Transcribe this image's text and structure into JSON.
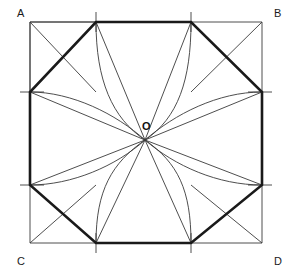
{
  "figure": {
    "type": "geometric-diagram",
    "canvas": {
      "width": 291,
      "height": 275,
      "background": "#ffffff"
    },
    "colors": {
      "thin_stroke": "#3a3a3a",
      "thick_stroke": "#1a1a1a",
      "label_text": "#1a1a1a"
    },
    "stroke_widths": {
      "thin": 0.9,
      "thick": 2.6
    },
    "square": {
      "name": "ABCD",
      "left": 30,
      "top": 22,
      "right": 262,
      "bottom": 243,
      "corners": [
        {
          "id": "A",
          "label": "A",
          "x": 30,
          "y": 22,
          "label_x": 17,
          "label_y": 17
        },
        {
          "id": "B",
          "label": "B",
          "x": 262,
          "y": 22,
          "label_x": 274,
          "label_y": 17
        },
        {
          "id": "C",
          "label": "C",
          "x": 30,
          "y": 243,
          "label_x": 17,
          "label_y": 265
        },
        {
          "id": "D",
          "label": "D",
          "x": 262,
          "y": 243,
          "label_x": 274,
          "label_y": 265
        }
      ]
    },
    "center": {
      "id": "O",
      "label": "O",
      "x": 145,
      "y": 140,
      "label_x": 142,
      "label_y": 130
    },
    "division_points": {
      "top": [
        {
          "x": 96,
          "y": 22
        },
        {
          "x": 191,
          "y": 22
        }
      ],
      "bottom": [
        {
          "x": 96,
          "y": 243
        },
        {
          "x": 191,
          "y": 243
        }
      ],
      "left": [
        {
          "x": 30,
          "y": 92
        },
        {
          "x": 30,
          "y": 185
        }
      ],
      "right": [
        {
          "x": 262,
          "y": 92
        },
        {
          "x": 262,
          "y": 185
        }
      ]
    },
    "tick_marks": [
      {
        "name": "tick-top-left",
        "x1": 96,
        "y1": 12,
        "x2": 96,
        "y2": 32
      },
      {
        "name": "tick-top-right",
        "x1": 191,
        "y1": 12,
        "x2": 191,
        "y2": 32
      },
      {
        "name": "tick-bottom-left",
        "x1": 96,
        "y1": 233,
        "x2": 96,
        "y2": 253
      },
      {
        "name": "tick-bottom-right",
        "x1": 191,
        "y1": 233,
        "x2": 191,
        "y2": 253
      },
      {
        "name": "tick-left-upper",
        "x1": 20,
        "y1": 92,
        "x2": 44,
        "y2": 92
      },
      {
        "name": "tick-left-lower",
        "x1": 20,
        "y1": 185,
        "x2": 44,
        "y2": 185
      },
      {
        "name": "tick-right-upper",
        "x1": 248,
        "y1": 92,
        "x2": 272,
        "y2": 92
      },
      {
        "name": "tick-right-lower",
        "x1": 248,
        "y1": 185,
        "x2": 272,
        "y2": 185
      }
    ],
    "octagon": {
      "description": "Thick inscribed octagon through the eight edge division points",
      "points": "96,22 191,22 262,92 262,185 191,243 96,243 30,185 30,92"
    },
    "corner_diagonals": [
      {
        "name": "diag-A-to-top-tick",
        "x1": 30,
        "y1": 22,
        "x2": 96,
        "y2": 22
      },
      {
        "name": "diag-A-to-left-tick",
        "x1": 30,
        "y1": 22,
        "x2": 30,
        "y2": 92
      },
      {
        "name": "diag-A-cross-1",
        "x1": 30,
        "y1": 92,
        "x2": 96,
        "y2": 22
      },
      {
        "name": "diag-A-cross-2",
        "x1": 30,
        "y1": 22,
        "x2": 96,
        "y2": 92
      },
      {
        "name": "diag-B-cross-1",
        "x1": 262,
        "y1": 92,
        "x2": 191,
        "y2": 22
      },
      {
        "name": "diag-B-cross-2",
        "x1": 262,
        "y1": 22,
        "x2": 191,
        "y2": 92
      },
      {
        "name": "diag-C-cross-1",
        "x1": 30,
        "y1": 185,
        "x2": 96,
        "y2": 243
      },
      {
        "name": "diag-C-cross-2",
        "x1": 30,
        "y1": 243,
        "x2": 96,
        "y2": 185
      },
      {
        "name": "diag-D-cross-1",
        "x1": 262,
        "y1": 185,
        "x2": 191,
        "y2": 243
      },
      {
        "name": "diag-D-cross-2",
        "x1": 262,
        "y1": 243,
        "x2": 191,
        "y2": 185
      }
    ],
    "rays_to_center": [
      {
        "name": "ray-top-left-to-O",
        "x1": 96,
        "y1": 22,
        "x2": 145,
        "y2": 140
      },
      {
        "name": "ray-top-right-to-O",
        "x1": 191,
        "y1": 22,
        "x2": 145,
        "y2": 140
      },
      {
        "name": "ray-left-upper-to-O",
        "x1": 30,
        "y1": 92,
        "x2": 145,
        "y2": 140
      },
      {
        "name": "ray-right-upper-to-O",
        "x1": 262,
        "y1": 92,
        "x2": 145,
        "y2": 140
      },
      {
        "name": "ray-left-lower-to-O",
        "x1": 30,
        "y1": 185,
        "x2": 145,
        "y2": 140
      },
      {
        "name": "ray-right-lower-to-O",
        "x1": 262,
        "y1": 185,
        "x2": 145,
        "y2": 140
      },
      {
        "name": "ray-bottom-left-to-O",
        "x1": 96,
        "y1": 243,
        "x2": 145,
        "y2": 140
      },
      {
        "name": "ray-bottom-right-to-O",
        "x1": 191,
        "y1": 243,
        "x2": 145,
        "y2": 140
      }
    ],
    "arcs": [
      {
        "name": "arc-top-left-to-O",
        "d": "M 96 22 C 96 80 112 118 145 140"
      },
      {
        "name": "arc-top-right-to-O",
        "d": "M 191 22 C 191 80 178 118 145 140"
      },
      {
        "name": "arc-left-upper-to-O",
        "d": "M 30 92 C 72 92 116 114 145 140"
      },
      {
        "name": "arc-right-upper-to-O",
        "d": "M 262 92 C 218 92 175 114 145 140"
      },
      {
        "name": "arc-left-lower-to-O",
        "d": "M 30 185 C 72 185 116 166 145 140"
      },
      {
        "name": "arc-right-lower-to-O",
        "d": "M 262 185 C 218 185 175 166 145 140"
      },
      {
        "name": "arc-bottom-left-to-O",
        "d": "M 96 243 C 96 190 112 163 145 140"
      },
      {
        "name": "arc-bottom-right-to-O",
        "d": "M 191 243 C 191 190 178 163 145 140"
      }
    ]
  }
}
